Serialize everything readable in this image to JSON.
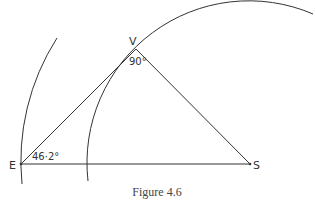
{
  "figure": {
    "caption": "Figure 4.6",
    "points": {
      "E": {
        "label": "E",
        "x": 21,
        "y": 164
      },
      "V": {
        "label": "V",
        "x": 136,
        "y": 49
      },
      "S": {
        "label": "S",
        "x": 250,
        "y": 164
      }
    },
    "angles": {
      "at_V": "90°",
      "at_E": "46·2°"
    },
    "arcs": [
      {
        "name": "earth-orbit",
        "center": "S",
        "radius": 229
      },
      {
        "name": "venus-orbit",
        "center": "S",
        "radius": 162
      }
    ],
    "colors": {
      "stroke": "#333333",
      "background": "#ffffff"
    }
  }
}
